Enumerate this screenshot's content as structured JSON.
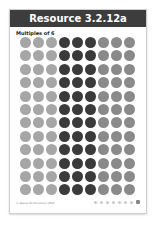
{
  "header": {
    "title": "Resource 3.2.12a"
  },
  "subtitle": "Multiples of 6",
  "grid": {
    "rows": 12,
    "columns": 9,
    "column_colors": [
      "#a6a6a6",
      "#a6a6a6",
      "#a6a6a6",
      "#3a3a3a",
      "#3a3a3a",
      "#3a3a3a",
      "#8a8a8a",
      "#8a8a8a",
      "#8a8a8a"
    ]
  },
  "footer": {
    "copyright": "© Assess for Excellence 2017",
    "pager_dots": 7
  },
  "colors": {
    "header_bg": "#3d3d3d",
    "light": "#a6a6a6",
    "dark": "#3a3a3a",
    "medium": "#8a8a8a"
  }
}
